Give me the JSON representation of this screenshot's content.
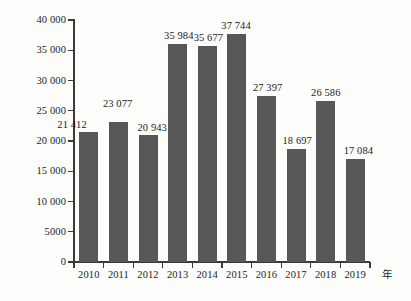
{
  "chart_data": {
    "type": "bar",
    "title": "",
    "xlabel": "年",
    "ylabel": "",
    "categories": [
      "2010",
      "2011",
      "2012",
      "2013",
      "2014",
      "2015",
      "2016",
      "2017",
      "2018",
      "2019"
    ],
    "values": [
      21412,
      23077,
      20943,
      35984,
      35677,
      37744,
      27397,
      18697,
      26586,
      17084
    ],
    "value_labels": [
      "21 412",
      "23 077",
      "20 943",
      "35 984",
      "35 677",
      "37 744",
      "27 397",
      "18 697",
      "26 586",
      "17 084"
    ],
    "ylim": [
      0,
      40000
    ],
    "ytick_values": [
      0,
      5000,
      10000,
      15000,
      20000,
      25000,
      30000,
      35000,
      40000
    ],
    "ytick_labels": [
      "0",
      "5000",
      "10 000",
      "15 000",
      "20 000",
      "25 000",
      "30 000",
      "35 000",
      "40 000"
    ],
    "grid": false,
    "legend": null,
    "bar_color": "#575757",
    "axis_color": "#3a3a3a",
    "background_color": "#fdfdfc"
  }
}
